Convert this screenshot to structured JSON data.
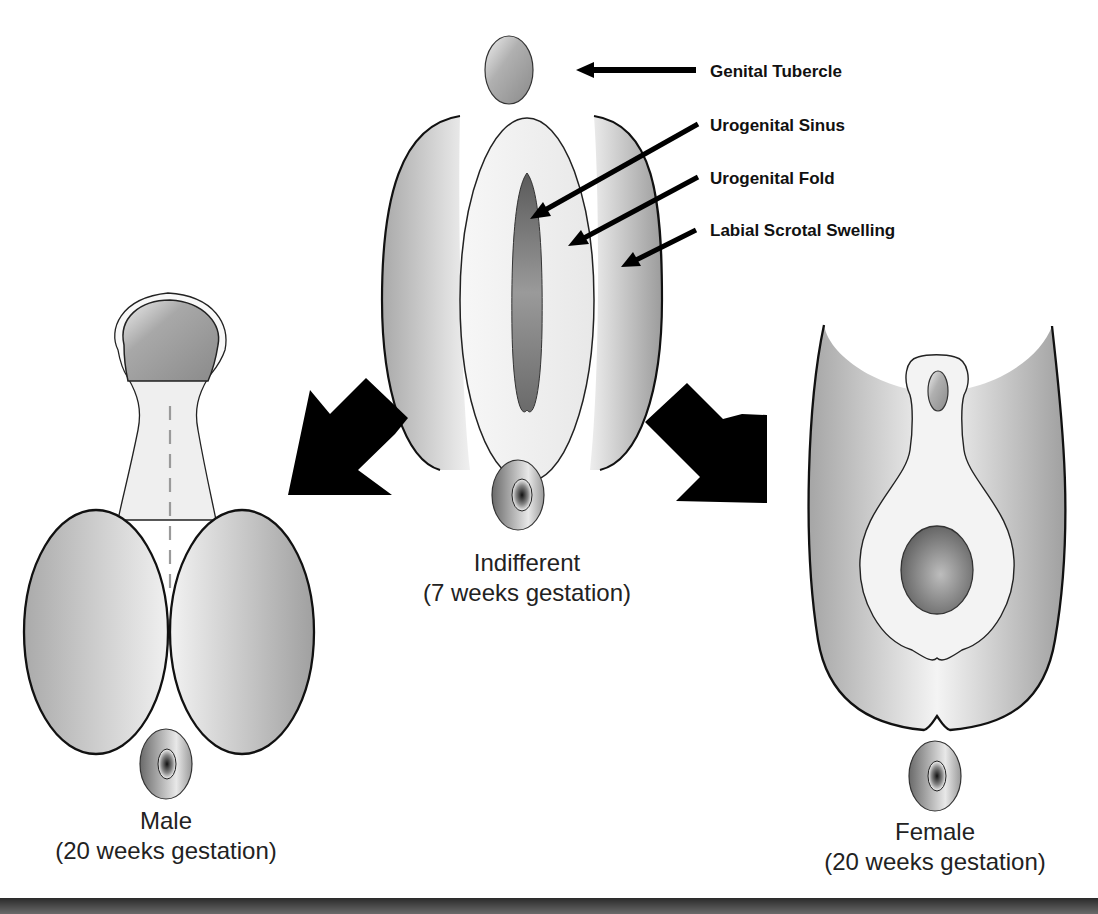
{
  "labels": {
    "genital_tubercle": "Genital Tubercle",
    "urogenital_sinus": "Urogenital Sinus",
    "urogenital_fold": "Urogenital Fold",
    "labial_scrotal_swelling": "Labial Scrotal Swelling"
  },
  "stages": {
    "indifferent": {
      "name": "Indifferent",
      "age": "(7 weeks gestation)"
    },
    "male": {
      "name": "Male",
      "age": "(20 weeks gestation)"
    },
    "female": {
      "name": "Female",
      "age": "(20 weeks gestation)"
    }
  },
  "colors": {
    "outline": "#111111",
    "arrow": "#000000",
    "fill_light": "#f2f2f2",
    "fill_mid": "#b8b8b8",
    "fill_dark": "#6e6e6e"
  }
}
